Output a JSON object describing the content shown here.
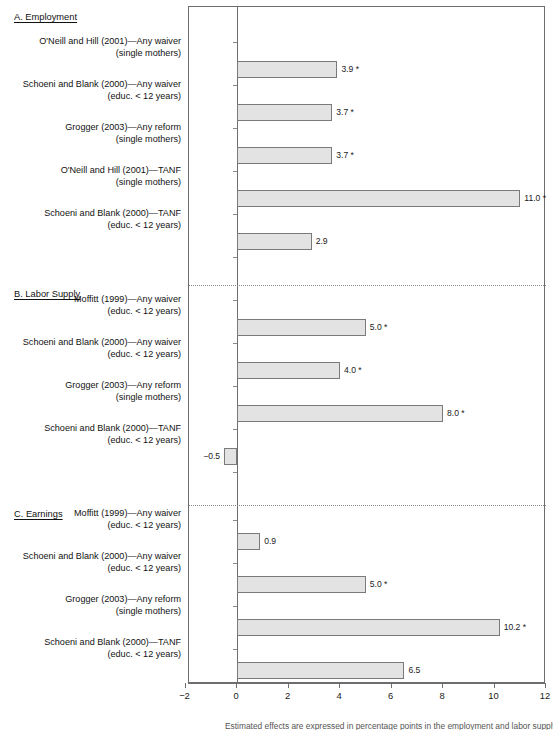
{
  "figure": {
    "footnote": "Estimated effects are expressed in percentage points in the employment and labor supply panels."
  },
  "chart_data": {
    "type": "bar",
    "orientation": "horizontal",
    "title": "",
    "xlabel": "",
    "ylabel": "",
    "xlim": [
      -2,
      12
    ],
    "xticks": [
      -2,
      0,
      2,
      4,
      6,
      8,
      10,
      12
    ],
    "xtick_labels": [
      "−2",
      "0",
      "2",
      "4",
      "6",
      "8",
      "10",
      "12"
    ],
    "grid": false,
    "legend": "none",
    "zero_line": 0,
    "panels": [
      {
        "id": "panel-a",
        "label": "A. Employment",
        "bars": [
          {
            "label_line1": "O'Neill and Hill (2001)—Any waiver",
            "label_line2": "(single mothers)",
            "value": 3.9,
            "value_label": "3.9 *",
            "significant": true
          },
          {
            "label_line1": "Schoeni and Blank (2000)—Any waiver",
            "label_line2": "(educ. < 12 years)",
            "value": 3.7,
            "value_label": "3.7 *",
            "significant": true
          },
          {
            "label_line1": "Grogger (2003)—Any reform",
            "label_line2": "(single mothers)",
            "value": 3.7,
            "value_label": "3.7 *",
            "significant": true
          },
          {
            "label_line1": "O'Neill and Hill (2001)—TANF",
            "label_line2": "(single mothers)",
            "value": 11.0,
            "value_label": "11.0 *",
            "significant": true
          },
          {
            "label_line1": "Schoeni and Blank (2000)—TANF",
            "label_line2": "(educ. < 12 years)",
            "value": 2.9,
            "value_label": "2.9",
            "significant": false
          }
        ]
      },
      {
        "id": "panel-b",
        "label": "B. Labor Supply",
        "bars": [
          {
            "label_line1": "Moffitt (1999)—Any waiver",
            "label_line2": "(educ. < 12 years)",
            "value": 5.0,
            "value_label": "5.0 *",
            "significant": true
          },
          {
            "label_line1": "Schoeni and Blank (2000)—Any waiver",
            "label_line2": "(educ. < 12 years)",
            "value": 4.0,
            "value_label": "4.0 *",
            "significant": true
          },
          {
            "label_line1": "Grogger (2003)—Any reform",
            "label_line2": "(single mothers)",
            "value": 8.0,
            "value_label": "8.0 *",
            "significant": true
          },
          {
            "label_line1": "Schoeni and Blank (2000)—TANF",
            "label_line2": "(educ. < 12 years)",
            "value": -0.5,
            "value_label": "−0.5",
            "significant": false
          }
        ]
      },
      {
        "id": "panel-c",
        "label": "C. Earnings",
        "bars": [
          {
            "label_line1": "Moffitt (1999)—Any waiver",
            "label_line2": "(educ. < 12 years)",
            "value": 0.9,
            "value_label": "0.9",
            "significant": false
          },
          {
            "label_line1": "Schoeni and Blank (2000)—Any waiver",
            "label_line2": "(educ. < 12 years)",
            "value": 5.0,
            "value_label": "5.0 *",
            "significant": true
          },
          {
            "label_line1": "Grogger (2003)—Any reform",
            "label_line2": "(single mothers)",
            "value": 10.2,
            "value_label": "10.2 *",
            "significant": true
          },
          {
            "label_line1": "Schoeni and Blank (2000)—TANF",
            "label_line2": "(educ. < 12 years)",
            "value": 6.5,
            "value_label": "6.5",
            "significant": false
          }
        ]
      }
    ]
  }
}
